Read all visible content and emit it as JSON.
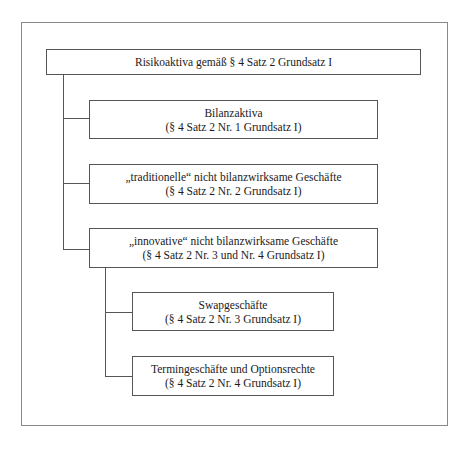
{
  "diagram": {
    "root": {
      "label": "Risikoaktiva gemäß § 4 Satz 2 Grundsatz I"
    },
    "children": [
      {
        "title": "Bilanzaktiva",
        "reference": "(§ 4 Satz 2 Nr. 1 Grundsatz I)"
      },
      {
        "title": "„traditionelle“ nicht bilanzwirksame Geschäfte",
        "reference": "(§ 4 Satz 2 Nr. 2 Grundsatz I)"
      },
      {
        "title": "„innovative“ nicht bilanzwirksame Geschäfte",
        "reference": "(§ 4 Satz 2 Nr. 3 und Nr. 4 Grundsatz I)",
        "children": [
          {
            "title": "Swapgeschäfte",
            "reference": "(§ 4 Satz 2 Nr. 3 Grundsatz I)"
          },
          {
            "title": "Termingeschäfte und Optionsrechte",
            "reference": "(§ 4 Satz 2 Nr. 4 Grundsatz I)"
          }
        ]
      }
    ]
  }
}
